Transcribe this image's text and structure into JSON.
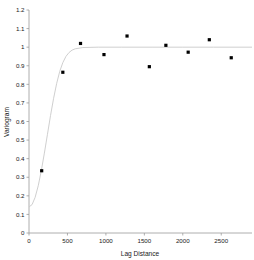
{
  "chart_data": {
    "type": "scatter",
    "title": "",
    "subtitle": "",
    "xlabel": "Lag Distance",
    "ylabel": "Variogram",
    "xlim": [
      0,
      2900
    ],
    "ylim": [
      0,
      1.2
    ],
    "grid": false,
    "legend": null,
    "xticks": [
      0,
      500,
      1000,
      1500,
      2000,
      2500
    ],
    "xticklabels": [
      "0",
      "500",
      "1000",
      "1500",
      "2000",
      "2500"
    ],
    "yticks": [
      0,
      0.1,
      0.2,
      0.3,
      0.4,
      0.5,
      0.6,
      0.7,
      0.8,
      0.9,
      1,
      1.1,
      1.2
    ],
    "yticklabels": [
      "0",
      "0.1",
      "0.2",
      "0.3",
      "0.4",
      "0.5",
      "0.6",
      "0.7",
      "0.8",
      "0.9",
      "1",
      "1.1",
      "1.2"
    ],
    "series": [
      {
        "name": "Experimental variogram",
        "type": "scatter",
        "marker": "square",
        "color": "#000000",
        "x": [
          165,
          440,
          670,
          975,
          1275,
          1565,
          1780,
          2070,
          2345,
          2630
        ],
        "y": [
          0.335,
          0.865,
          1.02,
          0.96,
          1.06,
          0.895,
          1.01,
          0.973,
          1.04,
          0.943
        ]
      },
      {
        "name": "Fitted model",
        "type": "line",
        "color": "#c9c9c9",
        "nugget": 0.14,
        "sill": 1.0,
        "range": 430,
        "x": [
          0,
          40,
          80,
          120,
          160,
          200,
          240,
          280,
          320,
          360,
          400,
          440,
          480,
          520,
          560,
          600,
          700,
          900,
          1200,
          1600,
          2000,
          2400,
          2900
        ],
        "y": [
          0.14,
          0.153,
          0.192,
          0.254,
          0.335,
          0.43,
          0.531,
          0.632,
          0.725,
          0.805,
          0.87,
          0.917,
          0.95,
          0.971,
          0.984,
          0.991,
          0.998,
          1.0,
          1.0,
          1.0,
          1.0,
          1.0,
          1.0
        ]
      }
    ]
  },
  "axes": {
    "x_title": "Lag Distance",
    "y_title": "Variogram"
  }
}
